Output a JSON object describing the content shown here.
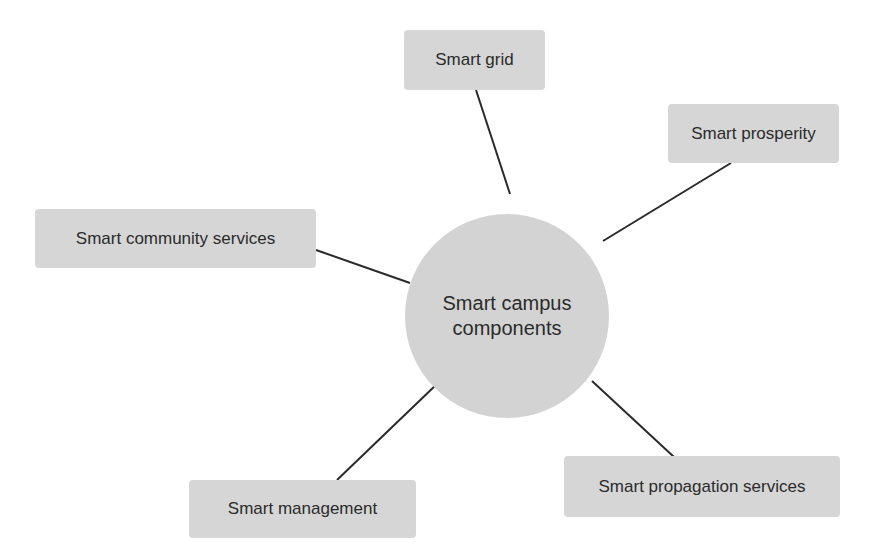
{
  "diagram": {
    "type": "hub-and-spoke",
    "center": {
      "line1": "Smart campus",
      "line2": "components"
    },
    "nodes": [
      {
        "id": "smart-grid",
        "label": "Smart grid"
      },
      {
        "id": "smart-prosperity",
        "label": "Smart prosperity"
      },
      {
        "id": "smart-community-services",
        "label": "Smart community services"
      },
      {
        "id": "smart-management",
        "label": "Smart management"
      },
      {
        "id": "smart-propagation-services",
        "label": "Smart propagation services"
      }
    ],
    "colors": {
      "node_fill": "#d6d6d6",
      "center_fill": "#d3d3d3",
      "edge": "#2a2a2a",
      "text": "#2b2b2b"
    }
  }
}
